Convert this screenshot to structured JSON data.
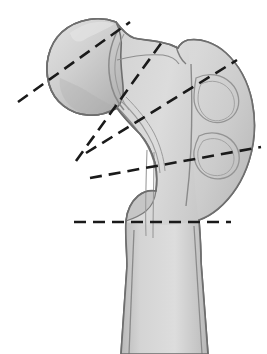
{
  "figure": {
    "view": "anterior",
    "width": 267,
    "height": 354,
    "background_color": "#ffffff"
  },
  "palette": {
    "bone_fill_light": "#d6d6d6",
    "bone_fill_mid": "#c9c9c9",
    "bone_fill_shadow": "#b4b4b4",
    "bone_fill_highlight": "#e2e2e2",
    "bone_outline": "#6e6e6e",
    "inner_contour": "#8a8a8a",
    "dashed_line": "#1a1a1a"
  },
  "anatomy": {
    "parts": [
      {
        "id": "femoral-head",
        "label": "Femoral head"
      },
      {
        "id": "femoral-neck",
        "label": "Femoral neck"
      },
      {
        "id": "greater-trochanter",
        "label": "Greater trochanter"
      },
      {
        "id": "lesser-trochanter",
        "label": "Lesser trochanter"
      },
      {
        "id": "femoral-shaft",
        "label": "Femoral shaft"
      },
      {
        "id": "intertrochanteric-crest",
        "label": "Intertrochanteric crest"
      }
    ]
  },
  "outlines": {
    "bone_silhouette": "M 116 22 C 100 16, 78 18, 62 32 C 48 45, 44 66, 49 84 C 54 102, 70 114, 88 115 C 98 116, 108 113, 117 108 C 124 118, 132 126, 140 134 C 147 142, 152 152, 155 163 C 157 172, 157 182, 156 191 C 150 190, 143 192, 138 196 C 131 202, 127 211, 126 221 C 125 235, 127 252, 127 266 L 121 354 L 208 354 L 201 262 C 201 248, 200 233, 199 220 C 205 218, 212 214, 218 209 C 232 197, 243 180, 249 161 C 255 142, 256 121, 252 101 C 248 82, 239 65, 226 53 C 215 43, 201 38, 188 40 C 184 41, 180 44, 178 48 C 172 45, 166 43, 160 42 C 151 40, 142 40, 134 38 C 128 36, 122 30, 116 22 Z",
    "head_outline": "M 116 22 C 100 16, 78 18, 62 32 C 48 45, 44 66, 49 84 C 54 102, 70 114, 88 115 C 98 116, 108 113, 117 108 C 122 102, 124 94, 123 86 C 122 74, 120 62, 121 50 C 122 40, 120 30, 116 22 Z",
    "head_inner_arc": "M 118 30 C 110 45, 107 62, 110 79 C 112 92, 117 102, 124 110",
    "neck_contour_superior": "M 117 60 C 132 56, 148 54, 163 55 C 170 56, 176 59, 179 64",
    "neck_contour_inferior": "M 114 104 C 124 114, 134 125, 142 137 C 149 147, 154 159, 156 171",
    "calcar_lines": "M 120 100 C 131 110, 141 122, 148 135 C 155 147, 159 160, 160 173",
    "trochanter_notch": "M 176 46 C 178 54, 181 60, 186 64",
    "trochanter_inner_a": "M 196 78 C 208 72, 222 74, 231 83 C 239 91, 241 103, 236 112 C 231 121, 219 125, 209 121 C 200 117, 194 108, 194 98 C 194 91, 195 84, 196 78 Z",
    "trochanter_inner_b": "M 199 136 C 211 130, 226 133, 234 143 C 241 152, 241 164, 234 172 C 227 180, 214 181, 205 175 C 197 170, 193 160, 194 151 C 195 145, 197 140, 199 136 Z",
    "intertrochanteric_ridge": "M 191 64 C 192 90, 192 120, 191 148 C 190 170, 188 190, 186 206",
    "shaft_medial_edge": "M 127 266 L 121 354",
    "shaft_lateral_edge": "M 201 262 L 208 354",
    "shaft_cortex_medial": "M 134 230 C 133 258, 131 300, 129 354",
    "shaft_cortex_lateral": "M 194 226 C 196 256, 199 304, 202 354",
    "medullary_line_left": "M 147 150 C 146 180, 145 208, 146 236",
    "medullary_line_right": "M 154 152 C 154 182, 153 210, 153 238"
  },
  "fracture_lines": [
    {
      "id": "subcapital-line",
      "label": "Subcapital level",
      "x1": 18,
      "y1": 102,
      "x2": 130,
      "y2": 22
    },
    {
      "id": "transcervical-line",
      "label": "Transcervical level",
      "x1": 76,
      "y1": 161,
      "x2": 162,
      "y2": 42
    },
    {
      "id": "basicervical-line",
      "label": "Basicervical level",
      "x1": 86,
      "y1": 153,
      "x2": 237,
      "y2": 60
    },
    {
      "id": "intertrochanteric-line",
      "label": "Intertrochanteric level",
      "x1": 90,
      "y1": 178,
      "x2": 261,
      "y2": 147
    },
    {
      "id": "subtrochanteric-line",
      "label": "Subtrochanteric level",
      "x1": 74,
      "y1": 222,
      "x2": 231,
      "y2": 222
    }
  ],
  "dash_style": {
    "dash_length": 12,
    "gap_length": 7,
    "stroke_width": 2.6
  }
}
